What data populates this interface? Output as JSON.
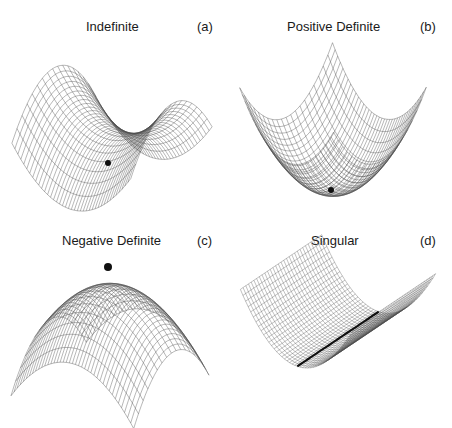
{
  "figure": {
    "background": "#ffffff",
    "mesh_color": "#4a4a4a",
    "marker_color": "#111111",
    "panels": [
      {
        "id": "a",
        "title": "Indefinite",
        "tag": "(a)",
        "surface": "saddle",
        "equation": "z = x^2 - y^2",
        "marker": "saddle point"
      },
      {
        "id": "b",
        "title": "Positive Definite",
        "tag": "(b)",
        "surface": "bowl",
        "equation": "z = x^2 + y^2",
        "marker": "minimum"
      },
      {
        "id": "c",
        "title": "Negative Definite",
        "tag": "(c)",
        "surface": "dome",
        "equation": "z = -(x^2 + y^2)",
        "marker": "maximum"
      },
      {
        "id": "d",
        "title": "Singular",
        "tag": "(d)",
        "surface": "trough",
        "equation": "z = x^2",
        "marker": "line of minima"
      }
    ]
  }
}
